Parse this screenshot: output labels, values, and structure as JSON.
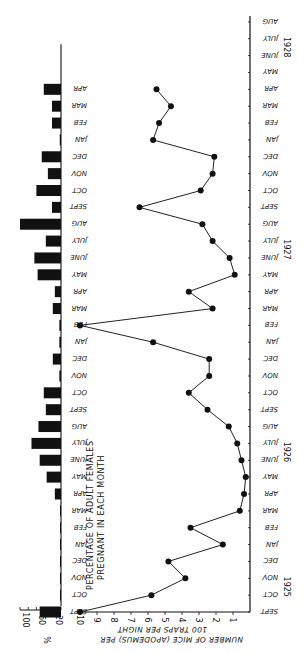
{
  "chart_data": {
    "type": "bar+line",
    "orientation": "rotated 90 degrees clockwise (time runs bottom-to-top)",
    "months": [
      "SEPT",
      "OCT",
      "NOV",
      "DEC",
      "JAN",
      "FEB",
      "MAR",
      "APR",
      "MAY",
      "JUNE",
      "JULY",
      "AUG",
      "SEPT",
      "OCT",
      "NOV",
      "DEC",
      "JAN",
      "FEB",
      "MAR",
      "APR",
      "MAY",
      "JUNE",
      "JULY",
      "AUG",
      "SEPT",
      "OCT",
      "NOV",
      "DEC",
      "JAN",
      "FEB",
      "MAR",
      "APR",
      "MAY",
      "JUNE",
      "JULY",
      "AUG"
    ],
    "years": [
      {
        "label": "1925",
        "month_index": 1.5
      },
      {
        "label": "1926",
        "month_index": 9.5
      },
      {
        "label": "1927",
        "month_index": 21.5
      },
      {
        "label": "1928",
        "month_index": 33.5
      }
    ],
    "series": [
      {
        "name": "Number of mice (Apodemus) per 100 traps per night",
        "type": "line",
        "start_month_index": 0,
        "values": [
          10.0,
          5.8,
          3.8,
          4.8,
          1.6,
          3.5,
          0.6,
          0.35,
          0.25,
          0.5,
          0.75,
          1.25,
          2.5,
          3.6,
          2.4,
          2.4,
          5.7,
          10.0,
          2.2,
          3.6,
          0.9,
          1.2,
          2.2,
          2.8,
          6.5,
          2.9,
          2.2,
          2.1,
          5.7,
          5.35,
          4.65,
          5.5
        ]
      },
      {
        "name": "Percentage of adult females pregnant in each month",
        "type": "bar",
        "start_month_index": 0,
        "values": [
          52,
          0,
          0,
          0,
          0,
          0,
          0,
          15,
          35,
          52,
          72,
          55,
          37,
          42,
          4,
          20,
          4,
          4,
          20,
          15,
          57,
          65,
          37,
          100,
          22,
          60,
          32,
          47,
          3,
          22,
          22,
          42
        ]
      }
    ],
    "line_axis": {
      "label_line1": "NUMBER OF MICE (APODEMUS) PER",
      "label_line2": "100 TRAPS PER NIGHT",
      "ticks": [
        10,
        9,
        8,
        7,
        6,
        5,
        4,
        3,
        2,
        1
      ],
      "range": [
        0,
        10
      ],
      "reversed": true
    },
    "bar_axis": {
      "unit": "%",
      "ticks": [
        100,
        60,
        20
      ],
      "range": [
        0,
        100
      ]
    },
    "bar_title_line1": "PERCENTAGE OF ADULT FEMALES",
    "bar_title_line2": "PREGNANT IN EACH MONTH",
    "bar_month_labels_last_index": 31,
    "grid": false,
    "legend": "none"
  }
}
